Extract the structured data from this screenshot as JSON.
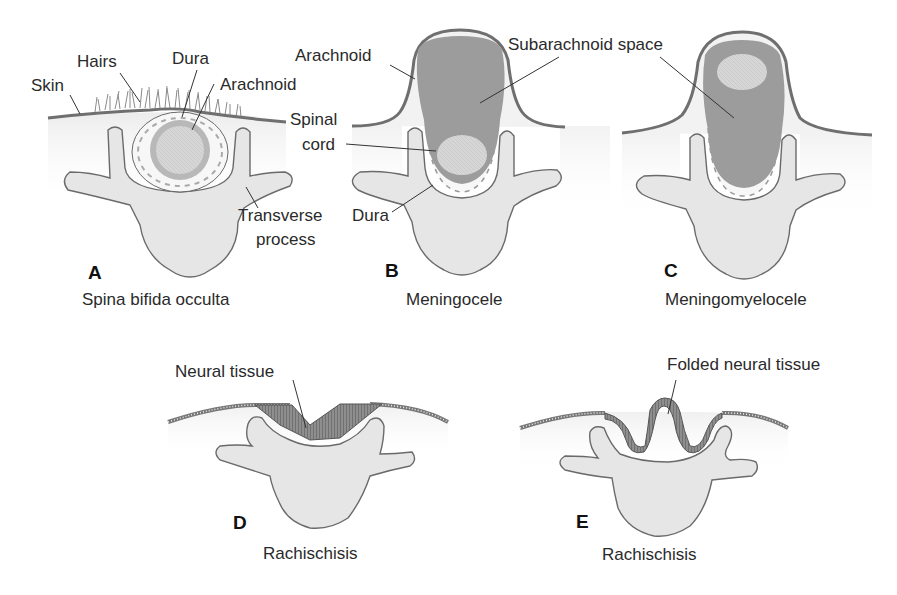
{
  "figure": {
    "colors": {
      "skin_line": "#6f6f6f",
      "tissue_fill": "#efefef",
      "bone_fill": "#e6e6e6",
      "bone_stroke": "#6a6a6a",
      "csf_fill": "#9c9c9c",
      "cord_fill": "#d4d4d4",
      "neural_fill": "#8a8a8a",
      "leader_line": "#333333"
    },
    "panels": [
      {
        "letter": "A",
        "caption": "Spina bifida occulta",
        "labels": [
          "Skin",
          "Hairs",
          "Dura",
          "Arachnoid",
          "Transverse",
          "process"
        ]
      },
      {
        "letter": "B",
        "caption": "Meningocele",
        "labels": [
          "Arachnoid",
          "Subarachnoid space",
          "Spinal",
          "cord",
          "Dura"
        ]
      },
      {
        "letter": "C",
        "caption": "Meningomyelocele",
        "labels": []
      },
      {
        "letter": "D",
        "caption": "Rachischisis",
        "labels": [
          "Neural tissue"
        ]
      },
      {
        "letter": "E",
        "caption": "Rachischisis",
        "labels": [
          "Folded neural tissue"
        ]
      }
    ]
  }
}
